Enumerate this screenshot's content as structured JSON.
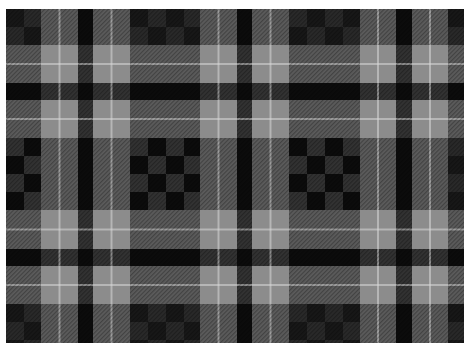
{
  "image": {
    "subject": "Grayscale tartan plaid fabric pattern",
    "colors": {
      "black": "#0c0c0c",
      "dark_gray": "#333333",
      "mid_gray": "#5c5c5c",
      "light_gray": "#8c8c8c",
      "white_line": "#d8d8d8",
      "background": "#ffffff"
    },
    "sett_columns": [
      "dark-check",
      "light",
      "black",
      "light",
      "dark-check",
      "light",
      "black",
      "light",
      "dark-check",
      "light",
      "black",
      "light",
      "dark"
    ],
    "sett_rows": [
      "dark",
      "light",
      "black",
      "light",
      "dark-check",
      "light",
      "black",
      "light",
      "dark"
    ],
    "pattern_repeat_count": {
      "horizontal": 3,
      "vertical": 2
    }
  }
}
